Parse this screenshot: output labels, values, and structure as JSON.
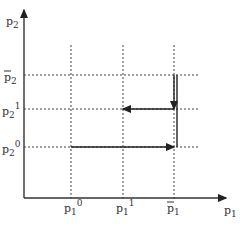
{
  "diagram": {
    "y_axis_label": "p",
    "y_axis_label_sub": "2",
    "x_axis_label": "p",
    "x_axis_label_sub": "1",
    "y_levels": [
      {
        "id": "p2bar",
        "base": "p",
        "sub": "2",
        "sup": "",
        "bar": true,
        "value": 3
      },
      {
        "id": "p2_1",
        "base": "p",
        "sub": "2",
        "sup": "1",
        "bar": false,
        "value": 2
      },
      {
        "id": "p2_0",
        "base": "p",
        "sub": "2",
        "sup": "0",
        "bar": false,
        "value": 1
      }
    ],
    "x_levels": [
      {
        "id": "p1_0",
        "base": "p",
        "sub": "1",
        "sup": "0",
        "bar": false,
        "value": 1
      },
      {
        "id": "p1_1",
        "base": "p",
        "sub": "1",
        "sup": "1",
        "bar": false,
        "value": 2
      },
      {
        "id": "p1bar",
        "base": "p",
        "sub": "1",
        "sup": "",
        "bar": true,
        "value": 3
      }
    ],
    "path_segments": [
      {
        "from": [
          "p1_0",
          "p2_0"
        ],
        "to": [
          "p1bar",
          "p2_0"
        ],
        "arrow": true,
        "direction": "right"
      },
      {
        "from": [
          "p1bar",
          "p2_0"
        ],
        "to": [
          "p1bar",
          "p2bar"
        ],
        "arrow": false,
        "direction": "up"
      },
      {
        "from": [
          "p1bar",
          "p2bar"
        ],
        "to": [
          "p1bar",
          "p2_1"
        ],
        "arrow": true,
        "direction": "down"
      },
      {
        "from": [
          "p1bar",
          "p2_1"
        ],
        "to": [
          "p1_1",
          "p2_1"
        ],
        "arrow": true,
        "direction": "left"
      }
    ]
  }
}
